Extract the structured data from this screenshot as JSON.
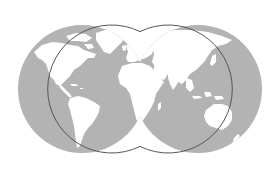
{
  "map": {
    "title": "World map (double-hemisphere projection)",
    "projection": "two overlapping hemispheres",
    "colors": {
      "background": "#ffffff",
      "ocean": "#b3b3b3",
      "land": "#ffffff",
      "outline": "#555555"
    },
    "hemispheres": [
      {
        "name": "Western hemisphere",
        "cx": 82,
        "cy": 89,
        "r": 64
      },
      {
        "name": "Eastern hemisphere",
        "cx": 198,
        "cy": 89,
        "r": 64
      }
    ],
    "landmasses": [
      "North America",
      "Greenland",
      "South America",
      "Europe",
      "Africa",
      "Asia",
      "Australia",
      "New Zealand"
    ]
  }
}
